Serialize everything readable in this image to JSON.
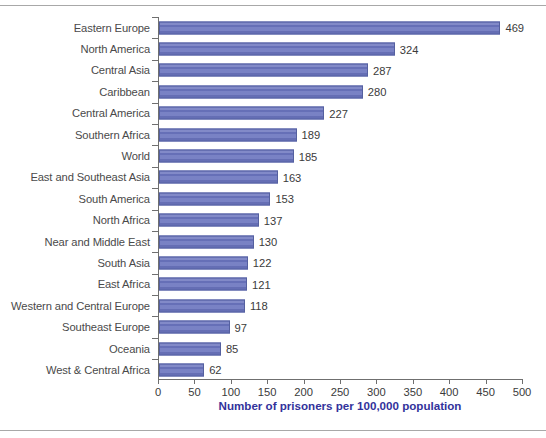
{
  "chart_data": {
    "type": "bar",
    "orientation": "horizontal",
    "title": "",
    "xlabel": "Number of prisoners per 100,000 population",
    "ylabel": "",
    "xlim": [
      0,
      500
    ],
    "xticks": [
      0,
      50,
      100,
      150,
      200,
      250,
      300,
      350,
      400,
      450,
      500
    ],
    "grid": false,
    "legend": null,
    "bar_color": "#6a74be",
    "bar_border_color": "#55609f",
    "axis_title_color": "#32329b",
    "label_color": "#4a4a4a",
    "categories": [
      "Eastern Europe",
      "North America",
      "Central Asia",
      "Caribbean",
      "Central America",
      "Southern Africa",
      "World",
      "East and Southeast Asia",
      "South America",
      "North Africa",
      "Near and Middle East",
      "South Asia",
      "East Africa",
      "Western and Central Europe",
      "Southeast Europe",
      "Oceania",
      "West & Central Africa"
    ],
    "values": [
      469,
      324,
      287,
      280,
      227,
      189,
      185,
      163,
      153,
      137,
      130,
      122,
      121,
      118,
      97,
      85,
      62
    ],
    "data_labels": [
      "469",
      "324",
      "287",
      "280",
      "227",
      "189",
      "185",
      "163",
      "153",
      "137",
      "130",
      "122",
      "121",
      "118",
      "97",
      "85",
      "62"
    ],
    "xtick_labels": [
      "0",
      "50",
      "100",
      "150",
      "200",
      "250",
      "300",
      "350",
      "400",
      "450",
      "500"
    ]
  }
}
